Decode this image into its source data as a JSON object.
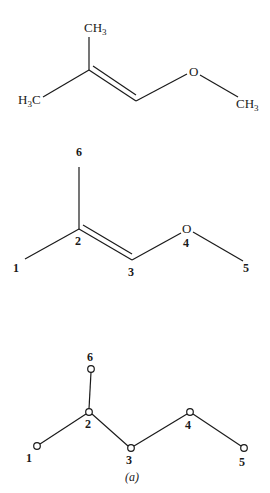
{
  "structure_formula": {
    "labels": {
      "top_methyl": {
        "main": "CH",
        "sub": "3"
      },
      "left_methyl": {
        "pre": "H",
        "sub": "3",
        "post": "C"
      },
      "oxygen": "O",
      "right_methyl": {
        "main": "CH",
        "sub": "3"
      }
    },
    "bonds": [
      {
        "from": "C2",
        "to": "CH3-top",
        "order": 1
      },
      {
        "from": "H3C",
        "to": "C2",
        "order": 1
      },
      {
        "from": "C2",
        "to": "C3",
        "order": 2
      },
      {
        "from": "C3",
        "to": "O",
        "order": 1
      },
      {
        "from": "O",
        "to": "CH3-right",
        "order": 1
      }
    ]
  },
  "structure_numbered": {
    "labels": {
      "n1": "1",
      "n2": "2",
      "n3": "3",
      "n4": "4",
      "n5": "5",
      "n6": "6",
      "oxygen": "O"
    }
  },
  "graph": {
    "nodes": [
      {
        "id": "1",
        "label": "1"
      },
      {
        "id": "2",
        "label": "2"
      },
      {
        "id": "3",
        "label": "3"
      },
      {
        "id": "4",
        "label": "4"
      },
      {
        "id": "5",
        "label": "5"
      },
      {
        "id": "6",
        "label": "6"
      }
    ],
    "edges": [
      [
        "1",
        "2"
      ],
      [
        "2",
        "6"
      ],
      [
        "2",
        "3"
      ],
      [
        "3",
        "4"
      ],
      [
        "4",
        "5"
      ]
    ],
    "caption": "(a)"
  }
}
